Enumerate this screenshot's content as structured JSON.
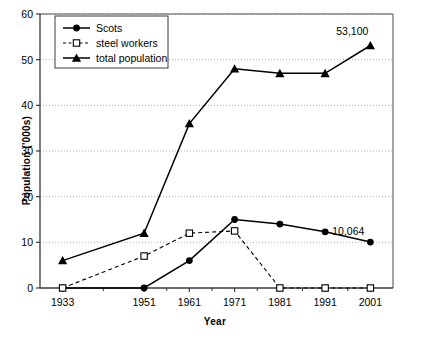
{
  "chart_data": {
    "type": "line",
    "title": "",
    "xlabel": "Year",
    "ylabel": "Population ('000s)",
    "categories": [
      "1933",
      "1951",
      "1961",
      "1971",
      "1981",
      "1991",
      "2001"
    ],
    "x": [
      1933,
      1951,
      1961,
      1971,
      1981,
      1991,
      2001
    ],
    "xlim": [
      1928,
      2006
    ],
    "ylim": [
      0,
      60
    ],
    "yticks": [
      0,
      10,
      20,
      30,
      40,
      50,
      60
    ],
    "ytick_labels": [
      "0",
      "10",
      "20",
      "30",
      "40",
      "50",
      "60"
    ],
    "grid": "horizontal-dotted",
    "legend_position": "top-left",
    "series": [
      {
        "name": "Scots",
        "marker": "filled-circle",
        "line": "solid",
        "color": "#000000",
        "values": [
          0,
          0,
          6,
          15,
          14,
          12.3,
          10.064
        ]
      },
      {
        "name": "steel workers",
        "marker": "open-square",
        "line": "dashed",
        "color": "#000000",
        "values": [
          0,
          7,
          12,
          12.5,
          0,
          0,
          0
        ]
      },
      {
        "name": "total population",
        "marker": "filled-triangle",
        "line": "solid",
        "color": "#000000",
        "values": [
          6,
          12,
          36,
          48,
          47,
          47,
          53.1
        ]
      }
    ],
    "annotations": [
      {
        "text": "53,100",
        "series": "total population",
        "x": 2001,
        "y": 53.1
      },
      {
        "text": "10,064",
        "series": "Scots",
        "x": 2001,
        "y": 10.064
      }
    ]
  },
  "legend": {
    "items": [
      {
        "label": "Scots"
      },
      {
        "label": "steel workers"
      },
      {
        "label": "total population"
      }
    ]
  },
  "axes": {
    "x_title": "Year",
    "y_title": "Population ('000s)"
  }
}
